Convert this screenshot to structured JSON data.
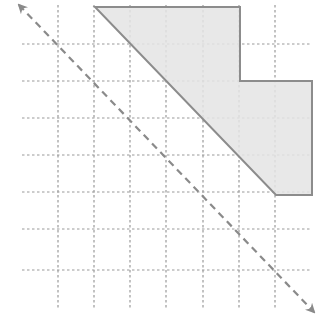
{
  "diagram": {
    "colors": {
      "background": "#ffffff",
      "grid": "#9a9a9a",
      "shape_fill": "#e4e4e4",
      "shape_stroke": "#8c8c8c",
      "arrow": "#8a8a8a"
    },
    "grid": {
      "vertical_x": [
        58,
        94,
        130,
        166,
        203,
        239,
        275
      ],
      "horizontal_y": [
        44,
        81,
        118,
        155,
        192,
        229,
        270
      ],
      "h_extent": [
        22,
        312
      ],
      "v_extent": [
        5,
        308
      ]
    },
    "shape": {
      "points": [
        [
          95,
          7
        ],
        [
          240,
          7
        ],
        [
          240,
          81
        ],
        [
          312,
          81
        ],
        [
          312,
          195
        ],
        [
          276,
          195
        ]
      ]
    },
    "arrow": {
      "start": [
        19,
        5
      ],
      "end": [
        314,
        312
      ],
      "bidirectional": true,
      "dashed": true
    }
  }
}
